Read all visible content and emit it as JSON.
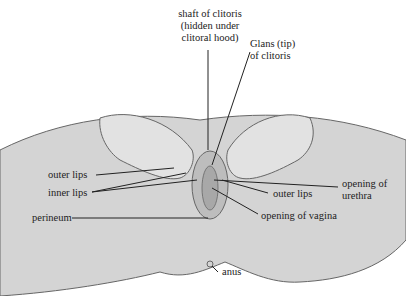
{
  "diagram": {
    "type": "labeled anatomical illustration",
    "labels": {
      "shaft": [
        "shaft of clitoris",
        "(hidden under",
        "clitoral hood)"
      ],
      "glans": [
        "Glans (tip)",
        "of clitoris"
      ],
      "opening_urethra": [
        "opening of",
        "urethra"
      ],
      "outer_lips_left": "outer lips",
      "inner_lips": "inner lips",
      "perineum": "perineum",
      "outer_lips_right": "outer lips",
      "opening_vagina": "opening of vagina",
      "anus": "anus"
    },
    "colors": {
      "skin_fill": "#d4d4d4",
      "skin_stroke": "#555555",
      "leader_line": "#222222",
      "label_text": "#222222"
    }
  }
}
